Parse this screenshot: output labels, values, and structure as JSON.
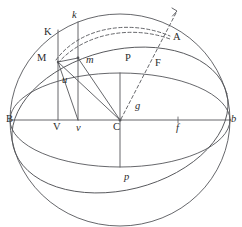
{
  "figure": {
    "type": "geometric-diagram",
    "width": 242,
    "height": 227,
    "background_color": "#ffffff",
    "stroke_color": "#55565a",
    "label_color": "#2b2b2b"
  },
  "geometry": {
    "sphere": {
      "center_x": 120,
      "center_y": 120,
      "radius_x": 110,
      "radius_y": 106
    },
    "equator_ellipse": {
      "center_x": 120,
      "center_y": 120,
      "radius_x": 110,
      "radius_y": 47
    },
    "oblique_ellipse": {
      "center_x": 120,
      "center_y": 120,
      "radius_x": 110,
      "radius_y": 70,
      "rotation_deg": -14
    },
    "center_point": {
      "x": 120,
      "y": 120
    },
    "points": {
      "B": {
        "x": 10,
        "y": 120
      },
      "b": {
        "x": 230,
        "y": 120
      },
      "C": {
        "x": 120,
        "y": 120
      },
      "V": {
        "x": 58,
        "y": 120
      },
      "v": {
        "x": 78,
        "y": 120
      },
      "f": {
        "x": 178,
        "y": 120
      },
      "M": {
        "x": 58,
        "y": 62
      },
      "m": {
        "x": 78,
        "y": 58
      },
      "K": {
        "x": 58,
        "y": 30
      },
      "k": {
        "x": 78,
        "y": 22
      },
      "P": {
        "x": 120,
        "y": 73
      },
      "p": {
        "x": 120,
        "y": 167
      },
      "A": {
        "x": 168,
        "y": 38
      },
      "F": {
        "x": 157,
        "y": 62
      }
    }
  },
  "labels": [
    {
      "id": "K",
      "text": "K",
      "x": 44,
      "y": 27,
      "style": "roman"
    },
    {
      "id": "k",
      "text": "k",
      "x": 72,
      "y": 10,
      "style": "italic"
    },
    {
      "id": "A",
      "text": "A",
      "x": 173,
      "y": 32,
      "style": "roman"
    },
    {
      "id": "M",
      "text": "M",
      "x": 37,
      "y": 53,
      "style": "roman"
    },
    {
      "id": "m",
      "text": "m",
      "x": 86,
      "y": 55,
      "style": "italic"
    },
    {
      "id": "P",
      "text": "P",
      "x": 125,
      "y": 53,
      "style": "roman"
    },
    {
      "id": "F",
      "text": "F",
      "x": 155,
      "y": 58,
      "style": "roman"
    },
    {
      "id": "u",
      "text": "u",
      "x": 62,
      "y": 75,
      "style": "italic"
    },
    {
      "id": "g",
      "text": "g",
      "x": 135,
      "y": 101,
      "style": "italic"
    },
    {
      "id": "B",
      "text": "B",
      "x": 6,
      "y": 114,
      "style": "roman"
    },
    {
      "id": "V",
      "text": "V",
      "x": 53,
      "y": 122,
      "style": "roman"
    },
    {
      "id": "v",
      "text": "v",
      "x": 76,
      "y": 123,
      "style": "italic"
    },
    {
      "id": "C",
      "text": "C",
      "x": 113,
      "y": 122,
      "style": "roman"
    },
    {
      "id": "f",
      "text": "f",
      "x": 176,
      "y": 123,
      "style": "italic"
    },
    {
      "id": "b",
      "text": "b",
      "x": 231,
      "y": 114,
      "style": "italic"
    },
    {
      "id": "p",
      "text": "p",
      "x": 124,
      "y": 172,
      "style": "italic"
    }
  ],
  "elements": {
    "sphere_outline": "sphere-outline-circle",
    "equator_upper": "equator-upper-arc",
    "equator_lower": "equator-lower-arc",
    "oblique_upper": "oblique-great-circle-upper-arc",
    "oblique_lower": "oblique-great-circle-lower-arc",
    "horizontal_axis": "horizontal-diameter-B-b",
    "vertical_axis": "vertical-axis-P-C-p",
    "ordinate_MV": "ordinate-line-K-M-V",
    "ordinate_mv": "ordinate-line-k-m-v",
    "radius_CM": "radius-line-C-M",
    "radius_Cm": "radius-line-C-m",
    "chord_Mv": "chord-line-M-v",
    "chord_Mm": "chord-line-M-m",
    "dashed_ray": "dashed-ray-C-g-F-A-arrow",
    "dashed_arc_1": "dashed-arc-outer-M-to-A",
    "dashed_arc_2": "dashed-arc-inner-m-to-A",
    "tick_f": "tick-mark-f"
  }
}
